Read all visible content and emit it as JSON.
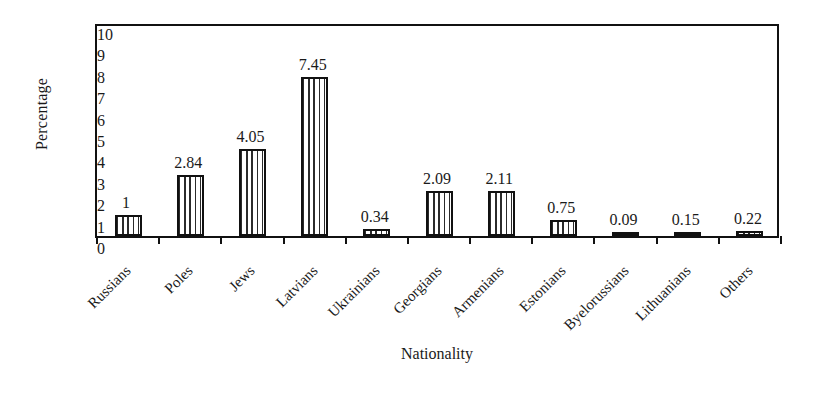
{
  "chart_data": {
    "type": "bar",
    "title": "",
    "xlabel": "Nationality",
    "ylabel": "Percentage",
    "categories": [
      "Russians",
      "Poles",
      "Jews",
      "Latvians",
      "Ukrainians",
      "Georgians",
      "Armenians",
      "Estonians",
      "Byelorussians",
      "Lithuanians",
      "Others"
    ],
    "values": [
      1,
      2.84,
      4.05,
      7.45,
      0.34,
      2.09,
      2.11,
      0.75,
      0.09,
      0.15,
      0.22
    ],
    "value_labels": [
      "1",
      "2.84",
      "4.05",
      "7.45",
      "0.34",
      "2.09",
      "2.11",
      "0.75",
      "0.09",
      "0.15",
      "0.22"
    ],
    "ylim": [
      0,
      10
    ],
    "yticks": [
      0,
      1,
      2,
      3,
      4,
      5,
      6,
      7,
      8,
      9,
      10
    ],
    "ytick_labels": [
      "0",
      "1",
      "2",
      "3",
      "4",
      "5",
      "6",
      "7",
      "8",
      "9",
      "10"
    ],
    "grid": false,
    "legend": false,
    "bar_fill": "vertical-hatch",
    "bar_edge_color": "#111111",
    "axis_color": "#111111",
    "background": "#ffffff"
  }
}
